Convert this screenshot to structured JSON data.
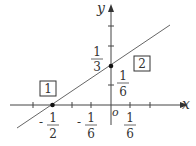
{
  "diagram": {
    "type": "coordinate-plane-line",
    "axes": {
      "x_label": "x",
      "y_label": "y",
      "origin_label": "o"
    },
    "line": {
      "description": "line through (-1/2, 0) and (0, 1/3)",
      "slope": "2/3",
      "y_intercept": "1/3",
      "x_intercept": "-1/2"
    },
    "points": [
      {
        "label": "1",
        "x": "-1/2",
        "y": "0"
      },
      {
        "label": "2",
        "x": "0",
        "y": "1/3"
      }
    ],
    "tick_labels": {
      "x": [
        {
          "sign": "-",
          "num": "1",
          "den": "2"
        },
        {
          "sign": "-",
          "num": "1",
          "den": "6"
        },
        {
          "sign": "",
          "num": "1",
          "den": "6"
        }
      ],
      "y": [
        {
          "num": "1",
          "den": "3"
        },
        {
          "num": "1",
          "den": "6"
        }
      ]
    },
    "boxes": [
      {
        "label": "1"
      },
      {
        "label": "2"
      }
    ],
    "colors": {
      "axis": "#333333",
      "line": "#555555",
      "point": "#111111"
    }
  }
}
